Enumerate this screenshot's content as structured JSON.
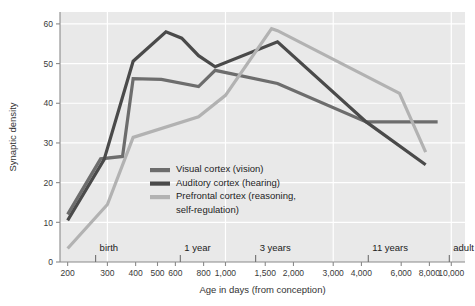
{
  "chart_data": {
    "type": "line",
    "title": "",
    "xlabel": "Age in days (from conception)",
    "ylabel": "Synaptic density",
    "xscale": "log",
    "xlim": [
      185,
      11500
    ],
    "ylim": [
      0,
      63
    ],
    "grid": true,
    "legend_position": "center-left-inside",
    "x_tick_labels": [
      "200",
      "300",
      "400",
      "500",
      "600",
      "800",
      "1,000",
      "1,500",
      "2,000",
      "3,000",
      "4,000",
      "6,000",
      "8,000",
      "10,000"
    ],
    "x_tick_values": [
      200,
      300,
      400,
      500,
      600,
      800,
      1000,
      1500,
      2000,
      3000,
      4000,
      6000,
      8000,
      10000
    ],
    "y_tick_labels": [
      "0",
      "10",
      "20",
      "30",
      "40",
      "50",
      "60"
    ],
    "y_tick_values": [
      0,
      10,
      20,
      30,
      40,
      50,
      60
    ],
    "milestones": [
      {
        "label": "birth",
        "value": 266
      },
      {
        "label": "1 year",
        "value": 631
      },
      {
        "label": "3 years",
        "value": 1360
      },
      {
        "label": "11 years",
        "value": 4290
      },
      {
        "label": "adult",
        "value": 9800
      }
    ],
    "series": [
      {
        "name": "Visual cortex (vision)",
        "color": "#6d6d6d",
        "x": [
          200,
          280,
          350,
          390,
          520,
          760,
          900,
          1700,
          4200,
          8700
        ],
        "values": [
          12.0,
          26.0,
          26.6,
          46.2,
          46.0,
          44.2,
          48.3,
          45.0,
          35.3,
          35.3
        ]
      },
      {
        "name": "Auditory cortex (hearing)",
        "color": "#4a4a4a",
        "x": [
          200,
          290,
          390,
          545,
          640,
          760,
          900,
          1700,
          4200,
          7700
        ],
        "values": [
          10.5,
          25.8,
          50.6,
          58.0,
          56.4,
          52.0,
          49.2,
          55.5,
          35.3,
          24.5
        ]
      },
      {
        "name": "Prefrontal cortex (reasoning, self-regulation)",
        "color": "#b2b2b2",
        "x": [
          200,
          300,
          390,
          760,
          1000,
          1600,
          1700,
          5900,
          7700
        ],
        "values": [
          3.4,
          14.5,
          31.4,
          36.6,
          42.0,
          58.8,
          58.3,
          42.5,
          27.7
        ]
      }
    ]
  },
  "legend": {
    "entries": [
      {
        "label": "Visual cortex (vision)",
        "color": "#6d6d6d"
      },
      {
        "label": "Auditory cortex (hearing)",
        "color": "#4a4a4a"
      },
      {
        "label": "Prefrontal cortex (reasoning,",
        "color": "#b2b2b2"
      },
      {
        "label": "self-regulation)",
        "color": ""
      }
    ]
  },
  "colors": {
    "plot_background": "#e9e9e9",
    "gridline": "#ffffff",
    "axis": "#8a8a8a",
    "text": "#2b2b2b"
  }
}
